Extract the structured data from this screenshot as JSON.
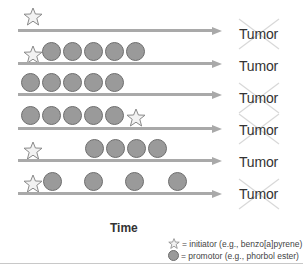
{
  "diagram": {
    "title": "",
    "x_axis_label": "Time",
    "outcome_label": "Tumor",
    "colors": {
      "arrow": "#a9a9a9",
      "promotor_fill": "#9a9a9a",
      "promotor_stroke": "#6e6e6e",
      "initiator_fill": "#f2f2f2",
      "initiator_stroke": "#8a8a8a",
      "cross": "#d8d8d8",
      "text": "#333333"
    },
    "rows": [
      {
        "sequence": [
          "initiator"
        ],
        "outcome": "Tumor",
        "tumor_formed": false
      },
      {
        "sequence": [
          "initiator",
          "promotor",
          "promotor",
          "promotor",
          "promotor",
          "promotor"
        ],
        "outcome": "Tumor",
        "tumor_formed": true
      },
      {
        "sequence": [
          "promotor",
          "promotor",
          "promotor",
          "promotor",
          "promotor"
        ],
        "outcome": "Tumor",
        "tumor_formed": false
      },
      {
        "sequence": [
          "promotor",
          "promotor",
          "promotor",
          "promotor",
          "promotor",
          "initiator"
        ],
        "outcome": "Tumor",
        "tumor_formed": false
      },
      {
        "sequence": [
          "initiator",
          "gap",
          "gap",
          "promotor",
          "promotor",
          "promotor",
          "promotor"
        ],
        "outcome": "Tumor",
        "tumor_formed": true
      },
      {
        "sequence": [
          "initiator",
          "promotor (spaced)",
          "promotor (spaced)",
          "promotor (spaced)",
          "promotor (spaced)"
        ],
        "outcome": "Tumor",
        "tumor_formed": false
      }
    ],
    "legend": [
      {
        "icon": "star-icon",
        "text": "= initiator (e.g., benzo[a]pyrene)"
      },
      {
        "icon": "circle-icon",
        "text": "= promotor (e.g., phorbol ester)"
      }
    ]
  }
}
